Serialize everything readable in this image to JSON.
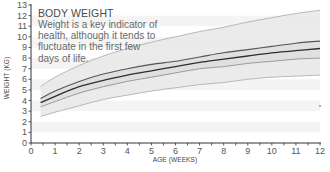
{
  "chart_data": {
    "type": "line",
    "title": "",
    "xlabel": "AGE (WEEKS)",
    "ylabel": "WEIGHT (KG)",
    "xlim": [
      0,
      12
    ],
    "ylim": [
      0,
      13
    ],
    "x_ticks": [
      0,
      1,
      2,
      3,
      4,
      5,
      6,
      7,
      8,
      9,
      10,
      11,
      12
    ],
    "y_ticks": [
      0,
      1,
      2,
      3,
      4,
      5,
      6,
      7,
      8,
      9,
      10,
      11,
      12,
      13
    ],
    "grid": "alternating horizontal light bands",
    "legend": "none",
    "x": [
      0.4,
      1,
      2,
      3,
      4,
      5,
      6,
      7,
      8,
      9,
      10,
      11,
      12
    ],
    "series": [
      {
        "name": "upper bound",
        "style": "light gray",
        "values": [
          5.3,
          6.2,
          7.3,
          8.2,
          8.9,
          9.5,
          10.0,
          10.5,
          10.9,
          11.4,
          11.8,
          12.2,
          12.5
        ]
      },
      {
        "name": "upper median",
        "style": "dark gray",
        "values": [
          4.2,
          4.9,
          5.8,
          6.5,
          7.0,
          7.4,
          7.7,
          8.1,
          8.5,
          8.8,
          9.1,
          9.4,
          9.6
        ]
      },
      {
        "name": "median",
        "style": "darkest",
        "values": [
          3.8,
          4.4,
          5.3,
          5.9,
          6.4,
          6.8,
          7.2,
          7.6,
          7.9,
          8.2,
          8.5,
          8.7,
          8.9
        ]
      },
      {
        "name": "lower median",
        "style": "medium gray",
        "values": [
          3.4,
          3.9,
          4.7,
          5.3,
          5.8,
          6.2,
          6.6,
          7.0,
          7.2,
          7.5,
          7.7,
          7.9,
          8.0
        ]
      },
      {
        "name": "lower bound",
        "style": "light gray",
        "values": [
          2.5,
          2.9,
          3.5,
          4.1,
          4.5,
          4.9,
          5.2,
          5.5,
          5.7,
          6.0,
          6.2,
          6.3,
          6.4
        ]
      }
    ],
    "annotation": {
      "title": "BODY WEIGHT",
      "body": "Weight is a key indicator of health, although it tends to fluctuate in the first few days of life."
    },
    "colors": {
      "outer_line": "#b8b8b8",
      "upper_median": "#555555",
      "median": "#2e2e2e",
      "lower_median": "#9a9a9a",
      "band": "#e8e8e8",
      "inner_band": "#dcdcdc",
      "axis": "#333333"
    }
  },
  "annotation": {
    "title": "BODY WEIGHT",
    "lines": [
      "Weight is a key indicator of",
      "health, although it tends to",
      "fluctuate in the first few",
      "days of life."
    ]
  },
  "axes": {
    "xlabel": "AGE (WEEKS)",
    "ylabel": "WEIGHT (KG)"
  }
}
